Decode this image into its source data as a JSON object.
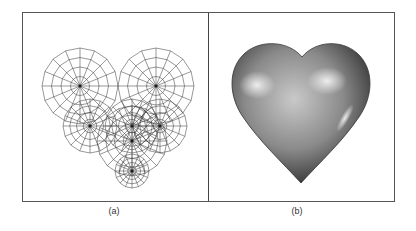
{
  "figure": {
    "panels": [
      {
        "id": "a",
        "caption": "(a)",
        "content": "wireframe of overlapping spherical meshes forming a heart"
      },
      {
        "id": "b",
        "caption": "(b)",
        "content": "shaded rendered 3D heart"
      }
    ],
    "colors": {
      "border": "#555555",
      "mesh": "#333333",
      "heart_dark": "#3a3a3a",
      "heart_light": "#d8d8d8"
    }
  }
}
